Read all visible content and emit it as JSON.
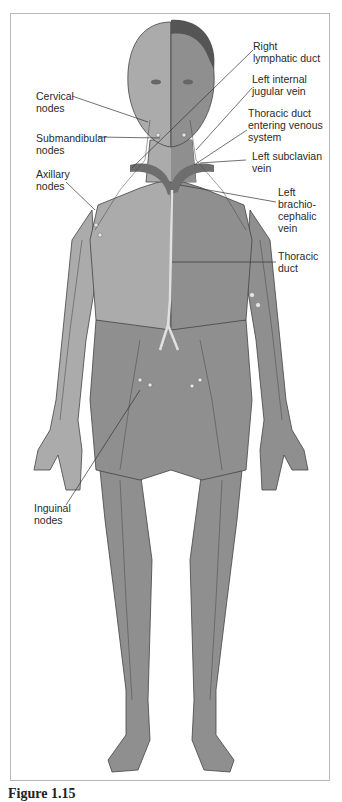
{
  "figure": {
    "caption": "Figure 1.15",
    "colors": {
      "skin_light": "#ababab",
      "skin_dark": "#8f8f8f",
      "hair": "#555555",
      "vein": "#6e6e6e",
      "duct": "#d9d9d9",
      "node": "#e6e6e6",
      "leader": "#333333"
    },
    "labels_left": [
      {
        "text": "Cervical\nnodes"
      },
      {
        "text": "Submandibular\nnodes"
      },
      {
        "text": "Axillary\nnodes"
      },
      {
        "text": "Inguinal\nnodes"
      }
    ],
    "labels_right": [
      {
        "text": "Right\nlymphatic duct"
      },
      {
        "text": "Left internal\njugular vein"
      },
      {
        "text": "Thoracic duct\nentering venous\nsystem"
      },
      {
        "text": "Left subclavian\nvein"
      },
      {
        "text": "Left\nbrachio-\ncephalic\nvein"
      },
      {
        "text": "Thoracic\nduct"
      }
    ]
  }
}
